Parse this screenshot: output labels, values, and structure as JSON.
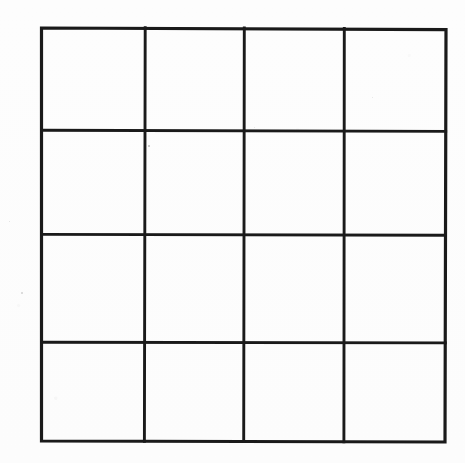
{
  "document": {
    "title": "Blank 4x4 Grid Worksheet",
    "kind": "scanned-blank-grid",
    "background_color": "#fdfdfd",
    "line_color": "#1a1a1a"
  },
  "grid": {
    "rows": 4,
    "columns": 4,
    "cell_count": 16,
    "outer_border": {
      "left": 41,
      "top": 27,
      "right": 446,
      "bottom": 442,
      "width": 405,
      "height": 415
    },
    "line_width_px": 3,
    "vertical_divider_x": [
      145,
      244,
      344
    ],
    "horizontal_divider_y": [
      130,
      234,
      342
    ],
    "column_x_edges": [
      41,
      145,
      244,
      344,
      446
    ],
    "row_y_edges": [
      27,
      130,
      234,
      342,
      442
    ],
    "cells": [
      {
        "row": 1,
        "col": 1,
        "label": ""
      },
      {
        "row": 1,
        "col": 2,
        "label": ""
      },
      {
        "row": 1,
        "col": 3,
        "label": ""
      },
      {
        "row": 1,
        "col": 4,
        "label": ""
      },
      {
        "row": 2,
        "col": 1,
        "label": ""
      },
      {
        "row": 2,
        "col": 2,
        "label": ""
      },
      {
        "row": 2,
        "col": 3,
        "label": ""
      },
      {
        "row": 2,
        "col": 4,
        "label": ""
      },
      {
        "row": 3,
        "col": 1,
        "label": ""
      },
      {
        "row": 3,
        "col": 2,
        "label": ""
      },
      {
        "row": 3,
        "col": 3,
        "label": ""
      },
      {
        "row": 3,
        "col": 4,
        "label": ""
      },
      {
        "row": 4,
        "col": 1,
        "label": ""
      },
      {
        "row": 4,
        "col": 2,
        "label": ""
      },
      {
        "row": 4,
        "col": 3,
        "label": ""
      },
      {
        "row": 4,
        "col": 4,
        "label": ""
      }
    ]
  },
  "artifacts": {
    "specks": [
      {
        "x": 148,
        "y": 145,
        "size": 2
      },
      {
        "x": 21,
        "y": 292,
        "size": 2
      },
      {
        "x": 9,
        "y": 221,
        "size": 1
      },
      {
        "x": 372,
        "y": 97,
        "size": 1
      },
      {
        "x": 254,
        "y": 127,
        "size": 1
      }
    ]
  }
}
